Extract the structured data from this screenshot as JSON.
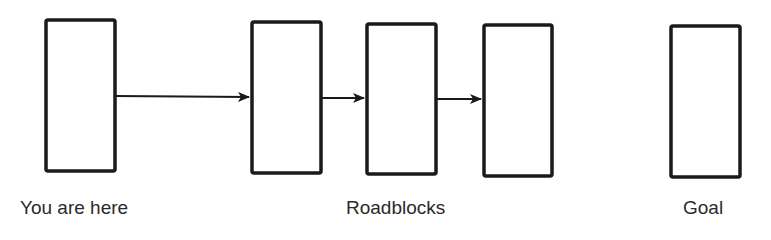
{
  "diagram": {
    "type": "flow",
    "colors": {
      "stroke": "#1a1a1a",
      "text": "#2a2a2a",
      "background": "#ffffff"
    },
    "nodes": [
      {
        "id": "start",
        "role": "current-position"
      },
      {
        "id": "roadblock-1",
        "role": "roadblock"
      },
      {
        "id": "roadblock-2",
        "role": "roadblock"
      },
      {
        "id": "roadblock-3",
        "role": "roadblock"
      },
      {
        "id": "goal",
        "role": "goal"
      }
    ],
    "edges": [
      {
        "from": "start",
        "to": "roadblock-1"
      },
      {
        "from": "roadblock-1",
        "to": "roadblock-2"
      },
      {
        "from": "roadblock-2",
        "to": "roadblock-3"
      }
    ],
    "labels": {
      "start": "You are here",
      "roadblocks": "Roadblocks",
      "goal": "Goal"
    }
  }
}
